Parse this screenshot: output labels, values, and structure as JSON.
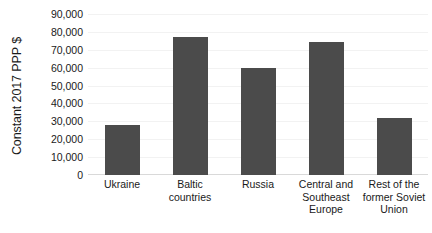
{
  "chart_data": {
    "type": "bar",
    "title": "",
    "xlabel": "",
    "ylabel": "Constant 2017 PPP $",
    "ylim": [
      0,
      90000
    ],
    "ytick_step": 10000,
    "grid": true,
    "legend": "none",
    "bar_color": "#4b4b4b",
    "categories": [
      "Ukraine",
      "Baltic\ncountries",
      "Russia",
      "Central and\nSoutheast\nEurope",
      "Rest of the\nformer Soviet\nUnion"
    ],
    "values": [
      28000,
      77000,
      60000,
      74500,
      32000
    ],
    "ytick_labels": [
      "90,000",
      "80,000",
      "70,000",
      "60,000",
      "50,000",
      "40,000",
      "30,000",
      "20,000",
      "10,000",
      "0"
    ],
    "ytick_values": [
      90000,
      80000,
      70000,
      60000,
      50000,
      40000,
      30000,
      20000,
      10000,
      0
    ]
  }
}
